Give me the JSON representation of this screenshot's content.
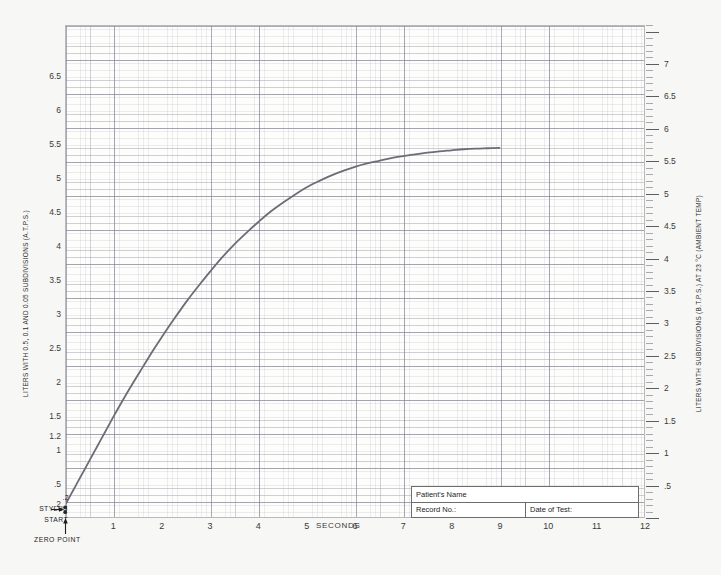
{
  "chart_data": {
    "type": "line",
    "title": "",
    "xlabel": "SECONDS",
    "ylabel_left": "LITERS WITH 0.5, 0.1 AND 0.05 SUBDIVISIONS (A.T.P.S.)",
    "ylabel_right": "LITERS WITH SUBDIVISIONS (B.T.P.S.) AT 23 °C (AMBIENT TEMP)",
    "xlim": [
      0,
      12
    ],
    "ylim": [
      0,
      7.25
    ],
    "ylim_right": [
      0,
      7.6
    ],
    "grid": true,
    "legend": "none",
    "x_ticks": [
      "1",
      "2",
      "3",
      "4",
      "5",
      "6",
      "7",
      "8",
      "9",
      "10",
      "11",
      "12"
    ],
    "x_tick_values": [
      1,
      2,
      3,
      4,
      5,
      6,
      7,
      8,
      9,
      10,
      11,
      12
    ],
    "y_ticks_left": [
      ".2",
      ".5",
      "1",
      "1.2",
      "1.5",
      "2",
      "2.5",
      "3",
      "3.5",
      "4",
      "4.5",
      "5",
      "5.5",
      "6",
      "6.5"
    ],
    "y_tick_values_left": [
      0.2,
      0.5,
      1,
      1.2,
      1.5,
      2,
      2.5,
      3,
      3.5,
      4,
      4.5,
      5,
      5.5,
      6,
      6.5
    ],
    "y_ticks_right": [
      ".5",
      "1",
      "1.5",
      "2",
      "2.5",
      "3",
      "3.5",
      "4",
      "4.5",
      "5",
      "5.5",
      "6",
      "6.5",
      "7"
    ],
    "y_tick_values_right": [
      0.5,
      1,
      1.5,
      2,
      2.5,
      3,
      3.5,
      4,
      4.5,
      5,
      5.5,
      6,
      6.5,
      7
    ],
    "series": [
      {
        "name": "Spirogram volume-time trace",
        "color": "#6f6b76",
        "x": [
          0.0,
          0.1,
          0.2,
          0.3,
          0.4,
          0.5,
          0.6,
          0.7,
          0.8,
          0.9,
          1.0,
          1.2,
          1.4,
          1.6,
          1.8,
          2.0,
          2.25,
          2.5,
          2.75,
          3.0,
          3.25,
          3.5,
          3.75,
          4.0,
          4.25,
          4.5,
          4.75,
          5.0,
          5.25,
          5.5,
          5.75,
          6.0,
          6.25,
          6.5,
          6.75,
          7.0,
          7.25,
          7.5,
          7.75,
          8.0,
          8.25,
          8.5,
          8.75,
          9.0
        ],
        "y": [
          0.2,
          0.33,
          0.46,
          0.59,
          0.72,
          0.85,
          0.98,
          1.11,
          1.24,
          1.37,
          1.5,
          1.75,
          1.99,
          2.22,
          2.45,
          2.67,
          2.93,
          3.18,
          3.41,
          3.63,
          3.84,
          4.03,
          4.2,
          4.36,
          4.51,
          4.64,
          4.76,
          4.87,
          4.96,
          5.04,
          5.11,
          5.17,
          5.22,
          5.26,
          5.3,
          5.33,
          5.355,
          5.38,
          5.4,
          5.415,
          5.43,
          5.44,
          5.445,
          5.45
        ]
      }
    ],
    "annotations": [
      {
        "name": "stylus-start",
        "text": "STYLUS\nSTART",
        "x": 0,
        "y": 0.2
      },
      {
        "name": "zero-point",
        "text": "ZERO POINT",
        "x": 0,
        "y": 0
      }
    ]
  },
  "axes": {
    "seconds_label": "SECONDS",
    "left_title": "LITERS WITH 0.5, 0.1 AND 0.05 SUBDIVISIONS (A.T.P.S.)",
    "right_title": "LITERS WITH SUBDIVISIONS (B.T.P.S.) AT 23 °C (AMBIENT TEMP)"
  },
  "annotations": {
    "stylus_line1": "STYLUS",
    "stylus_line2": "START",
    "zero_point": "ZERO POINT",
    "stylus_value": ".2"
  },
  "form": {
    "patient_name_label": "Patient's Name",
    "record_no_label": "Record No.:",
    "date_of_test_label": "Date of Test:",
    "patient_name_value": "",
    "record_no_value": "",
    "date_of_test_value": ""
  },
  "colors": {
    "curve": "#6f6b76",
    "paper": "#f7f7f5",
    "plot_background": "#fdfdfc",
    "frame": "#b9b9b9",
    "text": "#2e2e2e",
    "form_border": "#6d6d6d"
  }
}
